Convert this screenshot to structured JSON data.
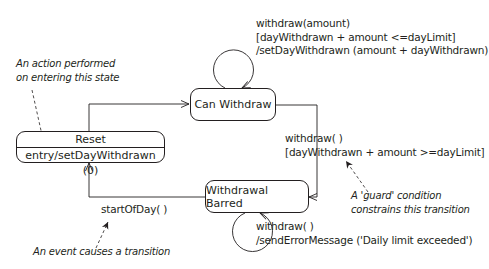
{
  "diagram": {
    "type": "uml-state-machine",
    "states": [
      {
        "id": "can-withdraw",
        "name": "Can Withdraw"
      },
      {
        "id": "reset",
        "name": "Reset",
        "entry_action": "entry/setDayWithdrawn (0)"
      },
      {
        "id": "withdrawal-barred",
        "name": "Withdrawal Barred"
      }
    ],
    "transitions": {
      "can_withdraw_self": {
        "event": "withdraw(amount)",
        "guard": "[dayWithdrawn + amount <=dayLimit]",
        "action": "/setDayWithdrawn (amount + dayWithdrawn)"
      },
      "can_to_barred": {
        "event": "withdraw( )",
        "guard": "[dayWithdrawn + amount >=dayLimit]"
      },
      "barred_self": {
        "event": "withdraw( )",
        "action": "/sendErrorMessage ('Daily limit exceeded')"
      },
      "barred_to_reset": {
        "event": "startOfDay( )"
      }
    },
    "annotations": {
      "entry_note_line1": "An action performed",
      "entry_note_line2": "on entering this state",
      "guard_note_line1": "A 'guard' condition",
      "guard_note_line2": "constrains this transition",
      "event_note": "An event causes a transition"
    }
  }
}
